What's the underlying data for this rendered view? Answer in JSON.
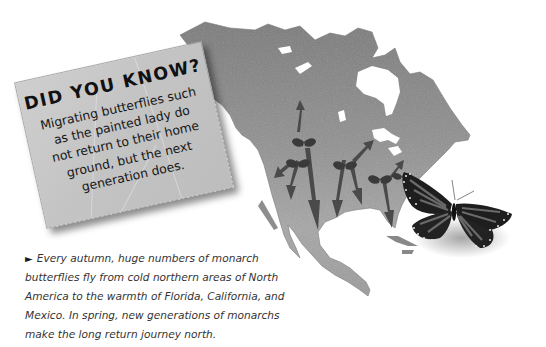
{
  "did_you_know": {
    "title": "DID YOU KNOW?",
    "body_lines": [
      "Migrating butterflies such",
      "as the painted lady do",
      "not return to their home",
      "ground, but the next",
      "generation does."
    ]
  },
  "caption": {
    "bullet_icon": "right-triangle-icon",
    "bullet": "►",
    "text": "Every autumn, huge numbers of monarch butterflies fly from cold northern areas of North America to the warmth of Florida, California, and Mexico. In spring, new generations of monarchs make the long return journey north.",
    "lines": [
      "Every autumn, huge numbers of monarch",
      "butterflies fly from cold northern areas of North",
      "America to the warmth of Florida, California, and",
      "Mexico. In spring, new generations of monarchs",
      "make the long return journey north."
    ]
  },
  "map": {
    "subject": "North America monarch butterfly migration map",
    "land_color": "#8c8c8c",
    "arrow_color": "#4a4a4a",
    "small_butterflies": 5,
    "large_butterfly": "monarch butterfly"
  }
}
